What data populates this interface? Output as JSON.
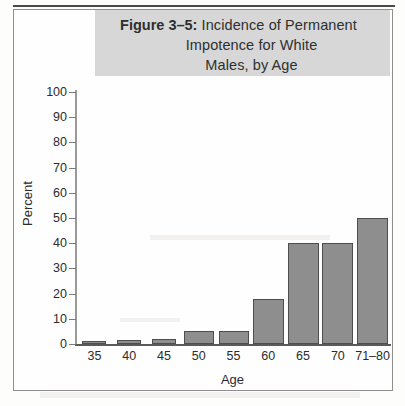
{
  "figure": {
    "title_prefix": "Figure 3–5:",
    "title_line1_rest": " Incidence of Permanent",
    "title_line2": "Impotence for White",
    "title_line3": "Males, by Age",
    "banner_color": "#d7d7d7",
    "bar_color": "#8e8e8e",
    "bar_outline_color": "#4e4e4e",
    "text_color": "#2c2c2c"
  },
  "chart_data": {
    "type": "bar",
    "title": "Figure 3–5: Incidence of Permanent Impotence for White Males, by Age",
    "xlabel": "Age",
    "ylabel": "Percent",
    "categories": [
      "35",
      "40",
      "45",
      "50",
      "55",
      "60",
      "65",
      "70",
      "71–80"
    ],
    "values": [
      1,
      1.5,
      2,
      5,
      5,
      18,
      40,
      40,
      50
    ],
    "ylim": [
      0,
      100
    ],
    "yticks": [
      0,
      10,
      20,
      30,
      40,
      50,
      60,
      70,
      80,
      90,
      100
    ],
    "ytick_labels": [
      "0",
      "10",
      "20",
      "30",
      "40",
      "50",
      "60",
      "70",
      "80",
      "90",
      "100"
    ],
    "grid": false,
    "legend": null,
    "series": [
      {
        "name": "Incidence of permanent impotence (%)",
        "values": [
          1,
          1.5,
          2,
          5,
          5,
          18,
          40,
          40,
          50
        ]
      }
    ]
  }
}
